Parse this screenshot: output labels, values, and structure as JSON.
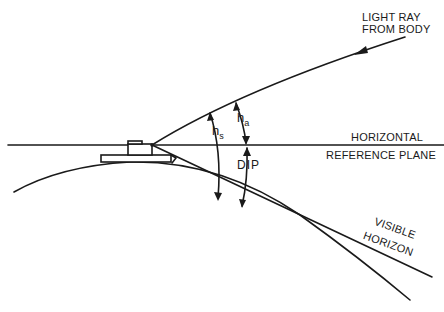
{
  "diagram": {
    "labels": {
      "light_ray_line1": "LIGHT RAY",
      "light_ray_line2": "FROM BODY",
      "horizontal": "HORIZONTAL",
      "reference_plane": "REFERENCE PLANE",
      "visible": "VISIBLE",
      "horizon": "HORIZON",
      "hs_base": "h",
      "hs_sub": "s",
      "ha_base": "h",
      "ha_sub": "a",
      "dip": "DIP"
    },
    "colors": {
      "line": "#1a1a1a",
      "background": "#ffffff"
    }
  }
}
